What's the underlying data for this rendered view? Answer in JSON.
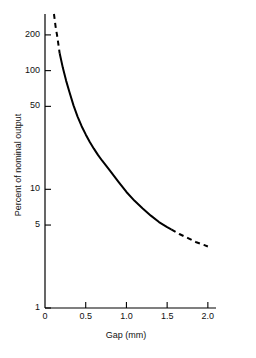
{
  "chart_data": {
    "type": "line",
    "title": "",
    "xlabel": "Gap (mm)",
    "ylabel": "Percent of nominal output",
    "xlim": [
      0,
      2.1
    ],
    "ylim": [
      1,
      300
    ],
    "yscale": "log",
    "xscale": "linear",
    "grid": false,
    "legend": null,
    "xticks": [
      {
        "value": 0,
        "label": "0"
      },
      {
        "value": 0.5,
        "label": "0.5"
      },
      {
        "value": 1.0,
        "label": "1.0"
      },
      {
        "value": 1.5,
        "label": "1.5"
      },
      {
        "value": 2.0,
        "label": "2.0"
      }
    ],
    "yticks": [
      {
        "value": 200,
        "label": "200"
      },
      {
        "value": 100,
        "label": "100"
      },
      {
        "value": 50,
        "label": "50"
      },
      {
        "value": 10,
        "label": "10"
      },
      {
        "value": 5,
        "label": "5"
      },
      {
        "value": 1,
        "label": "1"
      }
    ],
    "series": [
      {
        "name": "output-vs-gap",
        "style": "solid",
        "color": "#000000",
        "x": [
          0.18,
          0.22,
          0.26,
          0.3,
          0.35,
          0.4,
          0.45,
          0.5,
          0.55,
          0.6,
          0.65,
          0.7,
          0.8,
          0.9,
          1.0,
          1.1,
          1.2,
          1.3,
          1.4,
          1.5,
          1.55
        ],
        "y": [
          140,
          105,
          82,
          66,
          51,
          41,
          34,
          29,
          25,
          22,
          19.5,
          17.5,
          14.3,
          11.6,
          9.5,
          8.0,
          6.9,
          6.0,
          5.3,
          4.8,
          4.6
        ]
      },
      {
        "name": "output-vs-gap-extrapolated-low",
        "style": "dashed",
        "color": "#000000",
        "x": [
          0.11,
          0.13,
          0.15,
          0.18
        ],
        "y": [
          300,
          235,
          195,
          140
        ]
      },
      {
        "name": "output-vs-gap-extrapolated-high",
        "style": "dashed",
        "color": "#000000",
        "x": [
          1.55,
          1.65,
          1.75,
          1.85,
          1.95,
          2.0
        ],
        "y": [
          4.6,
          4.2,
          3.9,
          3.6,
          3.4,
          3.3
        ]
      }
    ]
  },
  "axes": {
    "axis_color": "#000000",
    "tick_color": "#000000"
  }
}
